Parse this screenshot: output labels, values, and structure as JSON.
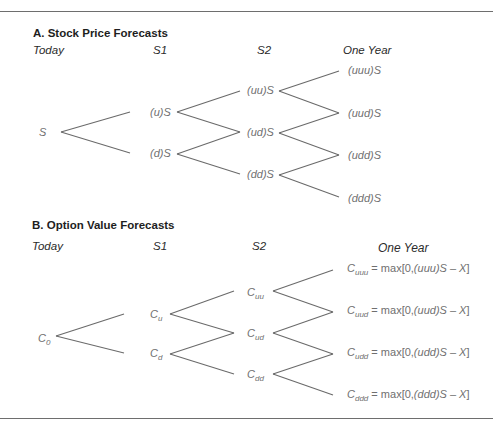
{
  "panel_a": {
    "title": "A. Stock Price Forecasts",
    "columns": [
      "Today",
      "S1",
      "S2",
      "One Year"
    ],
    "nodes": {
      "today": "S",
      "s1": [
        "(u)S",
        "(d)S"
      ],
      "s2": [
        "(uu)S",
        "(ud)S",
        "(dd)S"
      ],
      "one_year": [
        "(uuu)S",
        "(uud)S",
        "(udd)S",
        "(ddd)S"
      ]
    }
  },
  "panel_b": {
    "title": "B. Option Value Forecasts",
    "columns": [
      "Today",
      "S1",
      "S2",
      "One Year"
    ],
    "nodes": {
      "today": {
        "base": "C",
        "sub": "0"
      },
      "s1": [
        {
          "base": "C",
          "sub": "u"
        },
        {
          "base": "C",
          "sub": "d"
        }
      ],
      "s2": [
        {
          "base": "C",
          "sub": "uu"
        },
        {
          "base": "C",
          "sub": "ud"
        },
        {
          "base": "C",
          "sub": "dd"
        }
      ],
      "one_year": [
        {
          "base": "C",
          "sub": "uuu",
          "eq": " = max[0,",
          "path": "(uuu)",
          "tail": "S – X",
          "close": "]"
        },
        {
          "base": "C",
          "sub": "uud",
          "eq": " = max[0,",
          "path": "(uud)",
          "tail": "S – X",
          "close": "]"
        },
        {
          "base": "C",
          "sub": "udd",
          "eq": " = max[0,",
          "path": "(udd)",
          "tail": "S – X",
          "close": "]"
        },
        {
          "base": "C",
          "sub": "ddd",
          "eq": " = max[0,",
          "path": "(ddd)",
          "tail": "S – X",
          "close": "]"
        }
      ]
    }
  },
  "colors": {
    "line": "#6a6a6a",
    "node_text": "#6f6f6f",
    "title_text": "#1e1e1e"
  }
}
